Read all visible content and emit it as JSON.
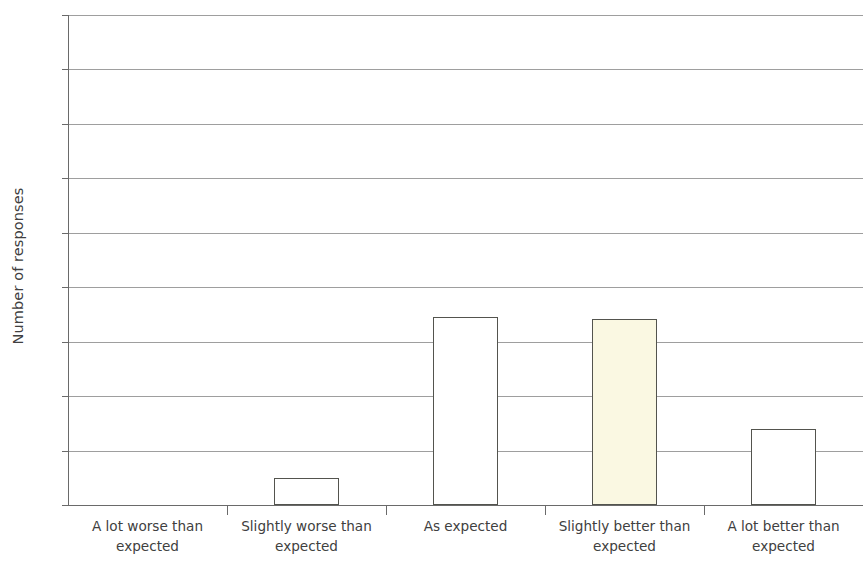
{
  "chart_data": {
    "type": "bar",
    "title": "",
    "subtitle": "",
    "xlabel": "",
    "ylabel": "Number of responses",
    "categories": [
      "A lot worse than expected",
      "Slightly worse than expected",
      "As expected",
      "Slightly better than expected",
      "A lot better than expected"
    ],
    "category_lines": [
      [
        "A lot worse than",
        "expected"
      ],
      [
        "Slightly worse than",
        "expected"
      ],
      [
        "As expected",
        ""
      ],
      [
        "Slightly better than",
        "expected"
      ],
      [
        "A lot better than",
        "expected"
      ]
    ],
    "values": [
      0,
      1,
      6.9,
      6.85,
      2.8
    ],
    "ylim": [
      0,
      18
    ],
    "ytick_values": [
      0,
      2,
      4,
      6,
      8,
      10,
      12,
      14,
      16,
      18
    ],
    "ytick_labels": [
      "0",
      "2",
      "4",
      "6",
      "8",
      "10",
      "12",
      "14",
      "16",
      "18"
    ],
    "grid": true,
    "legend": "none",
    "bar_colors": [
      "#ffffff",
      "#ffffff",
      "#ffffff",
      "#faf8e2",
      "#ffffff"
    ],
    "bar_border_color": "#53544e",
    "gridline_color": "#8d8d8d",
    "axis_color": "#6a6a6a",
    "background_color": "#ffffff"
  }
}
